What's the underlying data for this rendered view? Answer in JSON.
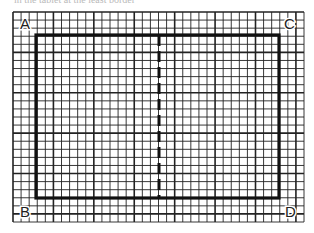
{
  "caption": "in the tablet at the least border",
  "diagram": {
    "type": "grid-rectangle",
    "grid": {
      "x0": 13,
      "y0": 12,
      "x1": 304,
      "y1": 222,
      "cell": 8.1,
      "major_every": 5
    },
    "rectangle": {
      "x": 36,
      "y": 35,
      "width": 243,
      "height": 163
    },
    "divider": {
      "x": 159,
      "style": "dashed"
    },
    "labels": [
      {
        "id": "A",
        "text": "A",
        "x": 20,
        "y": 29
      },
      {
        "id": "C",
        "text": "C",
        "x": 284,
        "y": 29
      },
      {
        "id": "B",
        "text": "B",
        "x": 20,
        "y": 217
      },
      {
        "id": "D",
        "text": "D",
        "x": 285,
        "y": 217
      }
    ]
  }
}
